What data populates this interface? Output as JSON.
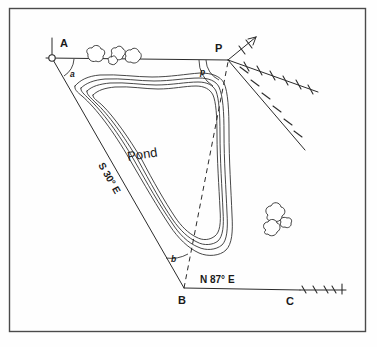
{
  "figure": {
    "background_color": "#fefefe",
    "border_color": "#4a4a4a",
    "ink_color": "#2b2b2b"
  },
  "labels": {
    "station_a": "A",
    "station_b": "B",
    "station_c": "C",
    "station_p": "P",
    "angle_a": "a",
    "angle_b": "b",
    "angle_p": "p",
    "bearing_ab": "S 30° E",
    "bearing_bc": "N 87° E",
    "feature_pond": "Pond"
  },
  "geometry": {
    "points": {
      "A": [
        52,
        58
      ],
      "B": [
        184,
        288
      ],
      "C": [
        290,
        290
      ],
      "P": [
        228,
        60
      ]
    },
    "lines": [
      {
        "name": "line-a-p",
        "from": "A",
        "to": "P",
        "style": "solid"
      },
      {
        "name": "line-a-b",
        "from": "A",
        "to": "B",
        "style": "solid",
        "bearing": "S 30° E"
      },
      {
        "name": "line-b-c",
        "from": "B",
        "to": "C",
        "style": "solid",
        "bearing": "N 87° E"
      },
      {
        "name": "line-b-p",
        "from": "B",
        "to": "P",
        "style": "dashed"
      }
    ],
    "angles": [
      {
        "name": "angle-at-a",
        "label": "a",
        "vertex": "A"
      },
      {
        "name": "angle-at-b",
        "label": "b",
        "vertex": "B"
      },
      {
        "name": "angle-at-p",
        "label": "p",
        "vertex": "P"
      }
    ],
    "contour_count": 4,
    "hatched_rays_from_p": 3,
    "bush_clusters": 2
  }
}
